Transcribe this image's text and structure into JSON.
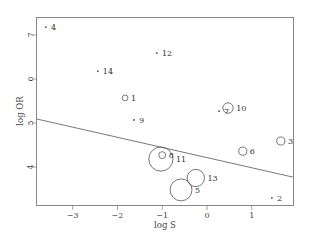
{
  "chart_data": {
    "type": "scatter",
    "title": "",
    "xlabel": "log S",
    "ylabel": "log OR",
    "xlim": [
      -3.8,
      1.92
    ],
    "ylim": [
      3.2,
      7.4
    ],
    "xticks": [
      -3,
      -2,
      -1,
      0,
      1
    ],
    "yticks": [
      4,
      5,
      6,
      7
    ],
    "grid": false,
    "legend": null,
    "points": [
      {
        "label": "4",
        "x": -3.6,
        "y": 7.18,
        "size": 1
      },
      {
        "label": "14",
        "x": -2.44,
        "y": 6.18,
        "size": 1
      },
      {
        "label": "12",
        "x": -1.12,
        "y": 6.59,
        "size": 1
      },
      {
        "label": "1",
        "x": -1.83,
        "y": 5.57,
        "size": 2
      },
      {
        "label": "9",
        "x": -1.63,
        "y": 5.07,
        "size": 1
      },
      {
        "label": "7",
        "x": 0.27,
        "y": 5.27,
        "size": 1
      },
      {
        "label": "10",
        "x": 0.47,
        "y": 5.34,
        "size": 4
      },
      {
        "label": "6",
        "x": 0.8,
        "y": 4.36,
        "size": 3
      },
      {
        "label": "3",
        "x": 1.65,
        "y": 4.59,
        "size": 3
      },
      {
        "label": "8",
        "x": -1.0,
        "y": 4.27,
        "size": 2.5
      },
      {
        "label": "11",
        "x": -1.03,
        "y": 4.18,
        "size": 10
      },
      {
        "label": "13",
        "x": -0.25,
        "y": 3.75,
        "size": 7
      },
      {
        "label": "5",
        "x": -0.58,
        "y": 3.48,
        "size": 9
      },
      {
        "label": "2",
        "x": 1.45,
        "y": 3.3,
        "size": 1
      }
    ],
    "regression_line": {
      "x": [
        -3.8,
        1.92
      ],
      "y": [
        5.09,
        3.77
      ]
    }
  }
}
